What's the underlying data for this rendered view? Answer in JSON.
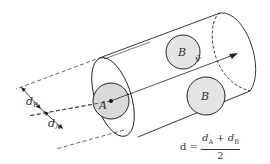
{
  "diagram": {
    "labels": {
      "particle_a": "A",
      "particle_b_top": "B",
      "particle_b_bottom": "B",
      "velocity": "v̄",
      "dim_b": "d",
      "dim_b_sub": "B",
      "dim_a": "d",
      "dim_a_sub": "A"
    },
    "formula": {
      "lhs": "d =",
      "num_d1": "d",
      "num_sub1": "A",
      "num_plus": " + ",
      "num_d2": "d",
      "num_sub2": "B",
      "denominator": "2"
    },
    "colors": {
      "stroke": "#222222",
      "particle_fill": "#d9d9d9",
      "text": "#333333"
    }
  }
}
